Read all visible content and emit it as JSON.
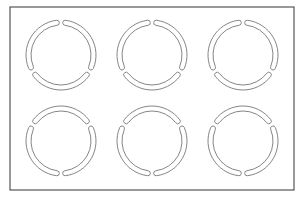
{
  "diagram": {
    "frame": {
      "x": 10,
      "y": 7,
      "width": 284,
      "height": 183,
      "stroke": "#555555"
    },
    "ring_stroke": "#777777",
    "outer_radius": 35,
    "inner_radius": 30,
    "gap_degrees": 6,
    "rings": [
      {
        "id": "ring-top-left",
        "cx": 61,
        "cy": 55,
        "gap_angles": [
          0,
          120,
          240
        ]
      },
      {
        "id": "ring-top-middle",
        "cx": 152,
        "cy": 55,
        "gap_angles": [
          0,
          120,
          240
        ]
      },
      {
        "id": "ring-top-right",
        "cx": 243,
        "cy": 55,
        "gap_angles": [
          0,
          120,
          240
        ]
      },
      {
        "id": "ring-bottom-left",
        "cx": 61,
        "cy": 141,
        "gap_angles": [
          60,
          180,
          300
        ]
      },
      {
        "id": "ring-bottom-middle",
        "cx": 152,
        "cy": 141,
        "gap_angles": [
          60,
          180,
          300
        ]
      },
      {
        "id": "ring-bottom-right",
        "cx": 243,
        "cy": 141,
        "gap_angles": [
          60,
          180,
          300
        ]
      }
    ]
  }
}
